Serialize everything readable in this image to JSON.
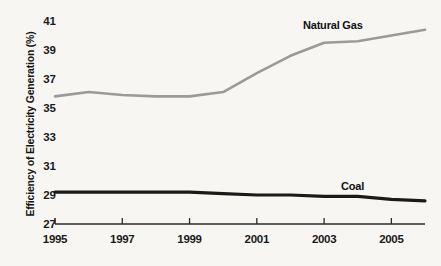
{
  "chart_data": {
    "type": "line",
    "title": "",
    "xlabel": "",
    "ylabel": "Efficiency of Electricity Generation (%)",
    "xlim": [
      1995,
      2006
    ],
    "ylim": [
      27,
      41
    ],
    "ytick_labels": [
      "41",
      "39",
      "37",
      "35",
      "33",
      "31",
      "29",
      "27"
    ],
    "ytick_values": [
      41,
      39,
      37,
      35,
      33,
      31,
      29,
      27
    ],
    "xtick_labels": [
      "1995",
      "1997",
      "1999",
      "2001",
      "2003",
      "2005"
    ],
    "xtick_values": [
      1995,
      1997,
      1999,
      2001,
      2003,
      2005
    ],
    "grid": false,
    "legend_position": "inline-annotations",
    "x": [
      1995,
      1996,
      1997,
      1998,
      1999,
      2000,
      2001,
      2002,
      2003,
      2004,
      2005,
      2006
    ],
    "series": [
      {
        "name": "Natural Gas",
        "color": "#9a9a9a",
        "values": [
          35.8,
          36.1,
          35.9,
          35.8,
          35.8,
          36.1,
          37.4,
          38.6,
          39.5,
          39.6,
          40.0,
          40.4
        ]
      },
      {
        "name": "Coal",
        "color": "#1a1a1a",
        "values": [
          29.2,
          29.2,
          29.2,
          29.2,
          29.2,
          29.1,
          29.0,
          29.0,
          28.9,
          28.9,
          28.7,
          28.6
        ]
      }
    ],
    "annotations": [
      {
        "text": "Natural Gas",
        "x": 2004.2,
        "y": 40.7
      },
      {
        "text": "Coal",
        "x": 2005.3,
        "y": 30.3
      }
    ],
    "axis_color": "#2a2a2a",
    "background": "#f7f6f3"
  }
}
